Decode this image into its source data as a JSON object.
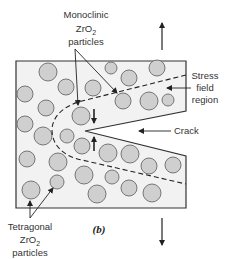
{
  "figure": {
    "label": "(b)",
    "colors": {
      "specimen_fill": "#f2f2f2",
      "specimen_stroke": "#333333",
      "particle_fill": "#cfcfcf",
      "particle_stroke": "#6a6a6a",
      "line": "#222222"
    },
    "labels": {
      "monoclinic": [
        "Monoclinic",
        "ZrO2",
        "particles"
      ],
      "tetragonal": [
        "Tetragonal",
        "ZrO2",
        "particles"
      ],
      "stress_field": [
        "Stress",
        "field",
        "region"
      ],
      "crack": "Crack"
    },
    "particles": [
      {
        "x": 48,
        "y": 72,
        "r": 9
      },
      {
        "x": 111,
        "y": 68,
        "r": 6
      },
      {
        "x": 129,
        "y": 78,
        "r": 8
      },
      {
        "x": 157,
        "y": 68,
        "r": 8
      },
      {
        "x": 25,
        "y": 94,
        "r": 8
      },
      {
        "x": 66,
        "y": 87,
        "r": 8
      },
      {
        "x": 93,
        "y": 88,
        "r": 8
      },
      {
        "x": 46,
        "y": 108,
        "r": 8
      },
      {
        "x": 123,
        "y": 101,
        "r": 8
      },
      {
        "x": 149,
        "y": 101,
        "r": 9
      },
      {
        "x": 168,
        "y": 100,
        "r": 6
      },
      {
        "x": 81,
        "y": 116,
        "r": 9
      },
      {
        "x": 25,
        "y": 124,
        "r": 8
      },
      {
        "x": 43,
        "y": 136,
        "r": 9
      },
      {
        "x": 67,
        "y": 136,
        "r": 7
      },
      {
        "x": 82,
        "y": 146,
        "r": 8
      },
      {
        "x": 108,
        "y": 153,
        "r": 9
      },
      {
        "x": 130,
        "y": 154,
        "r": 9
      },
      {
        "x": 149,
        "y": 166,
        "r": 8
      },
      {
        "x": 173,
        "y": 165,
        "r": 8
      },
      {
        "x": 27,
        "y": 159,
        "r": 8
      },
      {
        "x": 58,
        "y": 162,
        "r": 9
      },
      {
        "x": 112,
        "y": 177,
        "r": 7
      },
      {
        "x": 84,
        "y": 175,
        "r": 9
      },
      {
        "x": 129,
        "y": 188,
        "r": 8
      },
      {
        "x": 57,
        "y": 182,
        "r": 7
      },
      {
        "x": 31,
        "y": 190,
        "r": 9
      },
      {
        "x": 97,
        "y": 194,
        "r": 9
      },
      {
        "x": 152,
        "y": 193,
        "r": 9
      }
    ]
  }
}
